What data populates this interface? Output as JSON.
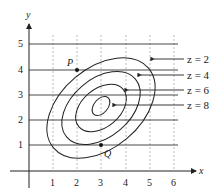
{
  "diagram": {
    "type": "contour_plot",
    "axes": {
      "x_label": "x",
      "y_label": "y",
      "x_ticks": [
        "1",
        "2",
        "3",
        "4",
        "5",
        "6"
      ],
      "y_ticks": [
        "1",
        "2",
        "3",
        "4",
        "5"
      ]
    },
    "points": [
      {
        "name": "P",
        "x": 2,
        "y": 4
      },
      {
        "name": "Q",
        "x": 3,
        "y": 1
      }
    ],
    "contours": [
      {
        "label": "z = 2",
        "value": 2
      },
      {
        "label": "z = 4",
        "value": 4
      },
      {
        "label": "z = 6",
        "value": 6
      },
      {
        "label": "z = 8",
        "value": 8
      }
    ],
    "colors": {
      "ink": "#222222",
      "grid": "#999999"
    }
  }
}
